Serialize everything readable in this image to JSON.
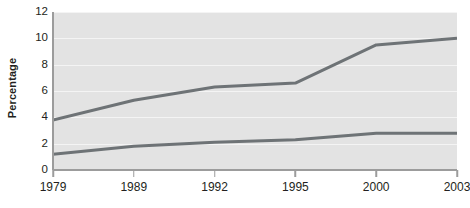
{
  "chart_data": {
    "type": "line",
    "title": "",
    "subtitle": "",
    "xlabel": "",
    "ylabel": "Percentage",
    "categories": [
      "1979",
      "1989",
      "1992",
      "1995",
      "2000",
      "2003"
    ],
    "x_tick_labels": [
      "1979",
      "1989",
      "1992",
      "1995",
      "2000",
      "2003"
    ],
    "y_tick_labels": [
      "0",
      "2",
      "4",
      "6",
      "8",
      "10",
      "12"
    ],
    "y_ticks": [
      0,
      2,
      4,
      6,
      8,
      10,
      12
    ],
    "ylim": [
      0,
      12
    ],
    "grid": true,
    "legend": false,
    "legend_position": "none",
    "annotations": [],
    "series": [
      {
        "name": "upper-line",
        "values": [
          3.8,
          5.3,
          6.3,
          6.6,
          9.5,
          10.0
        ],
        "color": "#6e7376"
      },
      {
        "name": "lower-line",
        "values": [
          1.2,
          1.8,
          2.1,
          2.3,
          2.8,
          2.8
        ],
        "color": "#6e7376"
      }
    ]
  },
  "style": {
    "plot_background": "#e3e3e3",
    "gridline_color": "#f4f4f4",
    "axis_color": "#9c9c9c",
    "text_color": "#231f20",
    "line_color": "#6e7376"
  }
}
